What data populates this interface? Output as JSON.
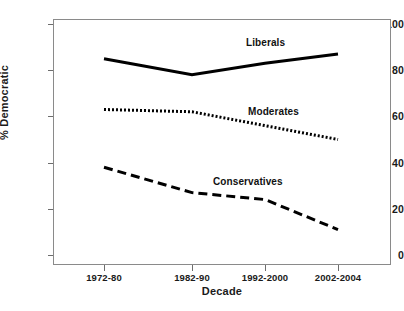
{
  "chart_data": {
    "type": "line",
    "title": "",
    "xlabel": "Decade",
    "ylabel": "% Democratic",
    "categories": [
      "1972-80",
      "1982-90",
      "1992-2000",
      "2002-2004"
    ],
    "yticks": [
      "0",
      "20",
      "40",
      "60",
      "80",
      "100"
    ],
    "ylim": [
      0,
      100
    ],
    "grid": false,
    "legend_position": "inline-annotations",
    "series": [
      {
        "name": "Liberals",
        "values": [
          85,
          78,
          83,
          87
        ],
        "style": "solid",
        "color": "#000000"
      },
      {
        "name": "Moderates",
        "values": [
          63,
          62,
          56,
          50
        ],
        "style": "dotted",
        "color": "#000000"
      },
      {
        "name": "Conservatives",
        "values": [
          38,
          27,
          24,
          11
        ],
        "style": "dashed",
        "color": "#000000"
      }
    ],
    "annotations": [
      {
        "text": "Liberals",
        "series": "Liberals"
      },
      {
        "text": "Moderates",
        "series": "Moderates"
      },
      {
        "text": "Conservatives",
        "series": "Conservatives"
      }
    ]
  }
}
